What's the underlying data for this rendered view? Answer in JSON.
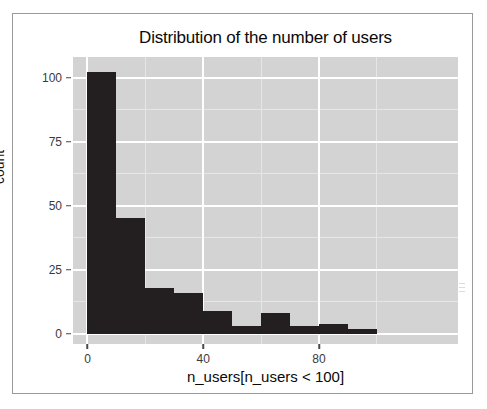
{
  "chart_data": {
    "type": "bar",
    "title": "Distribution of the number of users",
    "xlabel": "n_users[n_users < 100]",
    "ylabel": "count",
    "grid": true,
    "legend": false,
    "legend_position": "none",
    "bin_width": 10,
    "xlim": [
      -5,
      128
    ],
    "ylim": [
      -4,
      108
    ],
    "xticks": [
      0,
      40,
      80
    ],
    "xtick_labels": [
      "0",
      "40",
      "80"
    ],
    "yticks": [
      0,
      25,
      50,
      75,
      100
    ],
    "ytick_labels": [
      "0",
      "25",
      "50",
      "75",
      "100"
    ],
    "y_minor_ticks": [
      12.5,
      37.5,
      62.5,
      87.5
    ],
    "x_minor_ticks": [
      20,
      60,
      100
    ],
    "categories": [
      "0-10",
      "10-20",
      "20-30",
      "30-40",
      "40-50",
      "50-60",
      "60-70",
      "70-80",
      "80-90",
      "90-100"
    ],
    "bin_starts": [
      0,
      10,
      20,
      30,
      40,
      50,
      60,
      70,
      80,
      90
    ],
    "values": [
      102,
      45,
      18,
      16,
      9,
      3,
      8,
      3,
      4,
      2
    ],
    "bar_color": "#231f20",
    "panel_color": "#d3d3d3",
    "gridline_color": "#ffffff"
  },
  "figure": {
    "border_color": "#9a9a9a",
    "background": "#ffffff"
  },
  "icons": {
    "scan_artifact": "scan-speckle-artifact"
  }
}
